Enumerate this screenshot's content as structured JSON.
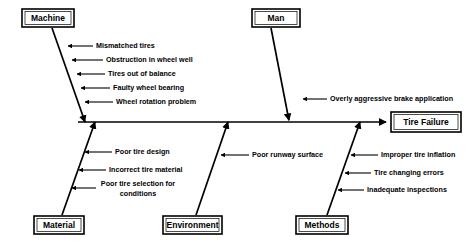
{
  "diagram": {
    "type": "fishbone-ishikawa",
    "effect": {
      "label": "Tire Failure"
    },
    "categories": [
      {
        "name": "Machine",
        "position": "top-left",
        "causes": [
          "Mismatched tires",
          "Obstruction in wheel well",
          "Tires out of balance",
          "Faulty wheel bearing",
          "Wheel rotation problem"
        ]
      },
      {
        "name": "Man",
        "position": "top-right",
        "causes": [
          "Overly aggressive brake application"
        ]
      },
      {
        "name": "Material",
        "position": "bottom-left",
        "causes": [
          "Poor tire design",
          "Incorrect tire material",
          "Poor tire selection for",
          "conditions"
        ]
      },
      {
        "name": "Environment",
        "position": "bottom-center",
        "causes": [
          "Poor runway surface"
        ]
      },
      {
        "name": "Methods",
        "position": "bottom-right",
        "causes": [
          "Improper tire inflation",
          "Tire changing errors",
          "Inadequate inspections"
        ]
      }
    ],
    "colors": {
      "line": "#000000",
      "background": "#ffffff",
      "text": "#000000"
    }
  }
}
